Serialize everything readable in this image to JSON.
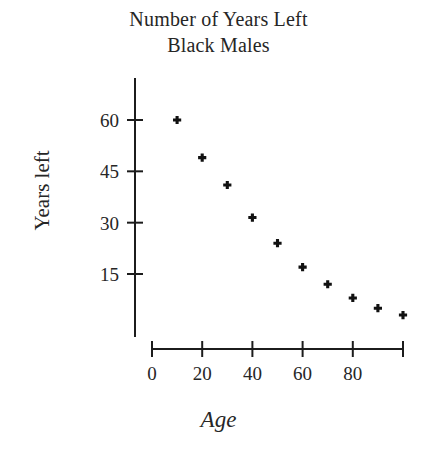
{
  "chart_data": {
    "type": "scatter",
    "title": "Number of Years Left",
    "subtitle": "Black Males",
    "title_lines": [
      "Number of Years Left",
      "Black Males"
    ],
    "xlabel": "Age",
    "ylabel": "Years left",
    "xlim": [
      0,
      104
    ],
    "ylim": [
      0,
      66
    ],
    "grid": false,
    "legend": "none",
    "marker": "plus",
    "x": [
      10,
      20,
      30,
      40,
      50,
      60,
      70,
      80,
      90,
      100
    ],
    "values": [
      60,
      49,
      41,
      31.5,
      24,
      17,
      12,
      8,
      5,
      3
    ],
    "points": [
      {
        "x": 10,
        "y": 60
      },
      {
        "x": 20,
        "y": 49
      },
      {
        "x": 30,
        "y": 41
      },
      {
        "x": 40,
        "y": 31.5
      },
      {
        "x": 50,
        "y": 24
      },
      {
        "x": 60,
        "y": 17
      },
      {
        "x": 70,
        "y": 12
      },
      {
        "x": 80,
        "y": 8
      },
      {
        "x": 90,
        "y": 5
      },
      {
        "x": 100,
        "y": 3
      }
    ],
    "xticks": [
      {
        "value": 0,
        "label": "0"
      },
      {
        "value": 20,
        "label": "20"
      },
      {
        "value": 40,
        "label": "40"
      },
      {
        "value": 60,
        "label": "60"
      },
      {
        "value": 80,
        "label": "80"
      },
      {
        "value": 100,
        "label": ""
      }
    ],
    "yticks": [
      {
        "value": 15,
        "label": "15"
      },
      {
        "value": 30,
        "label": "30"
      },
      {
        "value": 45,
        "label": "45"
      },
      {
        "value": 60,
        "label": "60"
      }
    ],
    "colors": {
      "background": "#ffffff",
      "axis": "#1c1c1c",
      "marker": "#111111",
      "text": "#262626"
    }
  }
}
